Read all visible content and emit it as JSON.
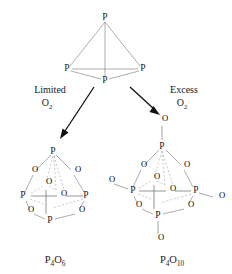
{
  "diagram": {
    "title_present": false,
    "background_color": "#ffffff",
    "bond_color": "#8a8a8a",
    "hidden_bond_color": "#b4b4b4",
    "text_color": "#1a1a1a",
    "arrow_color": "#111111"
  },
  "reactant": {
    "name": "white-phosphorus-tetrahedron",
    "atoms": [
      {
        "label": "P",
        "x": 105,
        "y": 18,
        "role": "apex"
      },
      {
        "label": "P",
        "x": 68,
        "y": 69,
        "role": "left"
      },
      {
        "label": "P",
        "x": 142,
        "y": 69,
        "role": "right"
      },
      {
        "label": "P",
        "x": 105,
        "y": 81,
        "role": "front"
      }
    ]
  },
  "conditions": {
    "left": {
      "line1": "Limited",
      "line2_element": "O",
      "line2_sub": "2"
    },
    "right": {
      "line1": "Excess",
      "line2_element": "O",
      "line2_sub": "2"
    }
  },
  "products": {
    "left": {
      "name": "phosphorus-trioxide-cage",
      "formula_main": "P",
      "formula_sub1": "4",
      "formula_element2": "O",
      "formula_sub2": "6",
      "label_x": 55,
      "label_y": 261,
      "phosphorus_count": 4,
      "bridging_oxygen_count": 6,
      "terminal_oxygen_count": 0
    },
    "right": {
      "name": "phosphorus-pentoxide-cage",
      "formula_main": "P",
      "formula_sub1": "4",
      "formula_element2": "O",
      "formula_sub2": "10",
      "label_x": 172,
      "label_y": 261,
      "phosphorus_count": 4,
      "bridging_oxygen_count": 6,
      "terminal_oxygen_count": 4
    }
  },
  "atom_labels": {
    "phosphorus": "P",
    "oxygen": "O"
  }
}
